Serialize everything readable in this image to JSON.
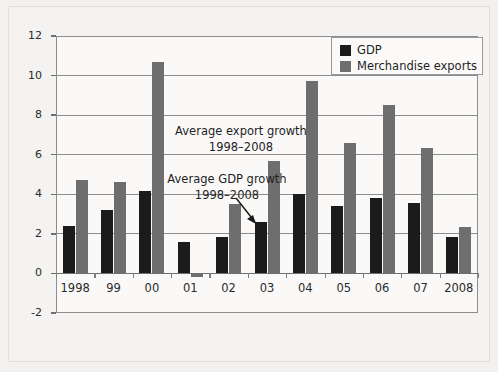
{
  "chart_data": {
    "type": "bar",
    "title": "",
    "subtitle": "",
    "xlabel": "",
    "ylabel": "",
    "ylim": [
      -2,
      12
    ],
    "yticks": [
      12,
      10,
      8,
      6,
      4,
      2,
      0,
      -2
    ],
    "ytick_labels": [
      "12",
      "10",
      "8",
      "6",
      "4",
      "2",
      "0",
      "-2"
    ],
    "grid": true,
    "legend_position": "top-right",
    "categories": [
      "1998",
      "99",
      "00",
      "01",
      "02",
      "03",
      "04",
      "05",
      "06",
      "07",
      "2008"
    ],
    "series": [
      {
        "name": "GDP",
        "color": "#1b1b1b",
        "values": [
          2.4,
          3.2,
          4.15,
          1.6,
          1.85,
          2.6,
          4.0,
          3.4,
          3.8,
          3.55,
          1.85
        ]
      },
      {
        "name": "Merchandise exports",
        "color": "#6e6e6e",
        "values": [
          4.7,
          4.6,
          10.7,
          -0.2,
          3.5,
          5.7,
          9.75,
          6.6,
          8.5,
          6.35,
          2.35
        ]
      }
    ],
    "annotations": [
      {
        "text_line1": "Average export growth",
        "text_line2": "1998–2008"
      },
      {
        "text_line1": "Average GDP growth",
        "text_line2": "1998–2008"
      }
    ]
  },
  "legend": {
    "items": [
      {
        "label": "GDP",
        "color": "#1b1b1b"
      },
      {
        "label": "Merchandise exports",
        "color": "#6e6e6e"
      }
    ]
  },
  "colors": {
    "gdp": "#1b1b1b",
    "exports": "#6e6e6e",
    "axis": "#8d8d8d",
    "background": "#f2f1ef",
    "plot_background": "#faf9f8"
  }
}
